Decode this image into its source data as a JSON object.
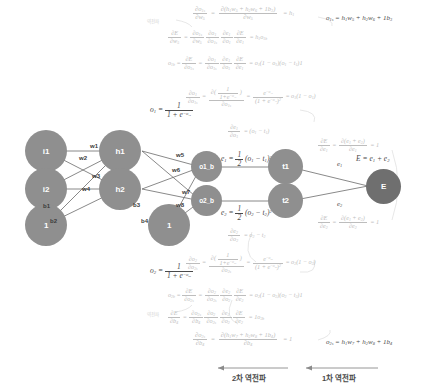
{
  "diagram": {
    "background": "#ffffff",
    "node_color": "#8f8f8f",
    "node_text_color": "#ffffff",
    "edge_color": "#6b6b6b",
    "faint_math_color": "#bdbdbd",
    "dark_math_color": "#4a4a4a"
  },
  "nodes": {
    "i1": "i1",
    "i2": "i2",
    "bias_input": "1",
    "h1": "h1",
    "h2": "h2",
    "bias_hidden": "1",
    "o1": "o1_b",
    "o2": "o2_b",
    "t1": "t1",
    "t2": "t2",
    "E": "E"
  },
  "weights": {
    "w1": "w1",
    "w2": "w2",
    "w3": "w3",
    "w4": "w4",
    "w5": "w5",
    "w6": "w6",
    "w7": "w7",
    "w8": "w8",
    "b1": "b1",
    "b2": "b2",
    "b3": "b3",
    "b4": "b4"
  },
  "equations": {
    "o1s_forward": "o₁ₛ = h₁w₅ + h₂w₆ + 1b₃",
    "o2s_forward": "o₂ₛ = h₁w₇ + h₂w₈ + 1b₄",
    "e1": "e₁ = ½(o₁ - t₁)²",
    "e2": "e₂ = ½(o₂ - t₂)²",
    "E_total": "E = e₁ + e₂",
    "o1_sigmoid": "o₁ = 1 / (1 + e^(-o₁ₛ))",
    "o2_sigmoid": "o₂ = 1 / (1 + e^(-o₂ₛ))",
    "de1_do1": "∂e₁/∂o₁ = (o₁ - t₁)",
    "de2_do2": "∂e₂/∂o₂ = o₂ - t₂",
    "dE_de1": "∂E/∂e₁ = ∂(e₁+e₂)/∂e₁ = 1",
    "dE_de2": "∂E/∂e₂ = ∂(e₁+e₂)/∂e₂ = 1",
    "o1b_chain": "o₁ᵦ = ∂E/∂o₁ₛ = ∂o₁/∂o₁ₛ · ∂e₁/∂o₁ · ∂E/∂e₁ = o₁(1-o₁)(o₁-t₁)1",
    "o2b_chain": "o₂ᵦ = ∂E/∂o₂ₛ = ∂o₂/∂o₂ₛ · ∂e₂/∂o₂ · ∂E/∂e₂ = o₂(1-o₂)(o₂-t₂)1",
    "sigmoid_deriv_1": "∂o₁/∂o₁ₛ = ∂(1/(1+e^(-o₁ₛ)))/∂o₁ₛ = e^(-o₁ₛ)/(1+e^(-o₁ₛ))² = o₁(1-o₁)",
    "sigmoid_deriv_2": "∂o₂/∂o₂ₛ = ∂(1/(1+e^(-o₂ₛ)))/∂o₂ₛ = e^(-o₂ₛ)/(1+e^(-o₂ₛ))² = o₂(1-o₂)",
    "dw5_top": "∂o₁ₛ/∂w₅ = ∂(h₁w₅+h₂w₆+1b₃)/∂w₅ = h₁",
    "dE_dw5": "∂E/∂w₅ = ∂o₁ₛ/∂w₅ · ∂o₁/∂o₁ₛ · ∂e₁/∂o₁ · ∂E/∂e₁ = h₁o₁ᵦ",
    "dE_db4": "∂E/∂b₄ = ∂o₂ₛ/∂b₄ · ∂o₂/∂o₂ₛ · ∂e₂/∂o₂ · ∂E/∂e₂ = 1o₂ᵦ",
    "db4": "∂o₂ₛ/∂b₄ = ∂(h₁w₇+h₂w₈+1b₄)/∂b₄ = 1"
  },
  "phases": {
    "second_backprop": "2차 역전파",
    "first_backprop": "1차 역전파"
  },
  "tags": {
    "top_left": "역전파",
    "bottom_left": "역전파"
  }
}
